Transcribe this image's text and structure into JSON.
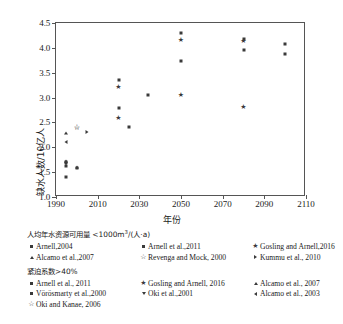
{
  "chart_data": {
    "type": "scatter",
    "title": "",
    "xlabel": "年份",
    "ylabel": "缺水人数/10亿人",
    "xlim": [
      1990,
      2110
    ],
    "ylim": [
      1.0,
      4.5
    ],
    "xticks": [
      1990,
      2010,
      2030,
      2050,
      2070,
      2090,
      2110
    ],
    "yticks": [
      "1.0",
      "1.5",
      "2.0",
      "2.5",
      "3.0",
      "3.5",
      "4.0",
      "4.5"
    ],
    "grid": false,
    "legend_position": "below-plot",
    "series": [
      {
        "name": "Arnell,2004",
        "marker": "square",
        "group": "availability",
        "points": [
          {
            "x": 1995,
            "y": 1.63
          },
          {
            "x": 1995,
            "y": 1.41
          }
        ]
      },
      {
        "name": "Alcamo et al.,2007",
        "marker": "triangle-up",
        "group": "availability",
        "points": [
          {
            "x": 1995,
            "y": 2.29
          }
        ]
      },
      {
        "name": "Arnell et al.,2011",
        "marker": "square",
        "group": "availability",
        "points": [
          {
            "x": 2020,
            "y": 2.79
          },
          {
            "x": 2025,
            "y": 2.41
          },
          {
            "x": 2050,
            "y": 3.74
          }
        ]
      },
      {
        "name": "Revenga and Mock, 2000",
        "marker": "star-open",
        "group": "availability",
        "points": [
          {
            "x": 2000,
            "y": 2.4
          }
        ]
      },
      {
        "name": "Gosling and Arnell,2016",
        "marker": "star",
        "group": "availability",
        "points": [
          {
            "x": 2020,
            "y": 3.21
          },
          {
            "x": 2050,
            "y": 4.15
          },
          {
            "x": 2080,
            "y": 4.13
          }
        ]
      },
      {
        "name": "Kummu et al., 2010",
        "marker": "triangle-right",
        "group": "availability",
        "points": [
          {
            "x": 2005,
            "y": 2.3
          }
        ]
      },
      {
        "name": "Arnell et al., 2011",
        "marker": "square",
        "group": "stress",
        "points": [
          {
            "x": 2020,
            "y": 3.36
          },
          {
            "x": 2034,
            "y": 3.06
          },
          {
            "x": 2050,
            "y": 4.3
          },
          {
            "x": 2080,
            "y": 4.18
          },
          {
            "x": 2100,
            "y": 4.07
          }
        ]
      },
      {
        "name": "Gosling and Arnell, 2016",
        "marker": "star",
        "group": "stress",
        "points": [
          {
            "x": 2020,
            "y": 2.59
          },
          {
            "x": 2050,
            "y": 3.06
          },
          {
            "x": 2080,
            "y": 2.81
          }
        ]
      },
      {
        "name": "Alcamo et al., 2007",
        "marker": "triangle-up",
        "group": "stress",
        "points": [
          {
            "x": 1995,
            "y": 1.73
          },
          {
            "x": 2000,
            "y": 1.6
          }
        ]
      },
      {
        "name": "Vörösmarty et al.,2000",
        "marker": "square",
        "group": "stress",
        "points": [
          {
            "x": 1995,
            "y": 1.7
          },
          {
            "x": 2000,
            "y": 1.58
          },
          {
            "x": 2080,
            "y": 3.96
          },
          {
            "x": 2100,
            "y": 3.87
          }
        ]
      },
      {
        "name": "Oki et al.,2001",
        "marker": "triangle-down",
        "group": "stress",
        "points": [
          {
            "x": 1995,
            "y": 1.67
          }
        ]
      },
      {
        "name": "Alcamo et al., 2003",
        "marker": "triangle-left",
        "group": "stress",
        "points": [
          {
            "x": 1995,
            "y": 2.11
          }
        ]
      },
      {
        "name": "Oki and Kanae, 2006",
        "marker": "star-open",
        "group": "stress",
        "points": [
          {
            "x": 2000,
            "y": 2.38
          }
        ]
      }
    ]
  },
  "axes": {
    "y_title": "缺水人数/10亿人",
    "x_title": "年份",
    "y_tick_labels": [
      "4.5",
      "4.0",
      "3.5",
      "3.0",
      "2.5",
      "2.0",
      "1.5",
      "1.0"
    ],
    "x_tick_labels": [
      "1990",
      "2010",
      "2030",
      "2050",
      "2070",
      "2090",
      "2110"
    ]
  },
  "legend": {
    "group1_header": "人均年水资源可用量 <1000m",
    "group1_header_sup": "3",
    "group1_header_tail": "/(人·a)",
    "group2_header": "紧迫系数>40%",
    "group1_rows": [
      [
        {
          "marker": "square",
          "label": "Arnell,2004"
        },
        {
          "marker": "square",
          "label": "Arnell et al.,2011"
        },
        {
          "marker": "star",
          "label": "Gosling and Arnell,2016"
        }
      ],
      [
        {
          "marker": "triangle-up",
          "label": "Alcamo et al.,2007"
        },
        {
          "marker": "star-open",
          "label": "Revenga and Mock, 2000"
        },
        {
          "marker": "triangle-right",
          "label": "Kummu et al., 2010"
        }
      ]
    ],
    "group2_rows": [
      [
        {
          "marker": "square",
          "label": "Arnell et al., 2011"
        },
        {
          "marker": "star",
          "label": "Gosling and Arnell, 2016"
        },
        {
          "marker": "triangle-up",
          "label": "Alcamo et al., 2007"
        }
      ],
      [
        {
          "marker": "square",
          "label": "Vörösmarty et al.,2000"
        },
        {
          "marker": "triangle-down",
          "label": "Oki et al.,2001"
        },
        {
          "marker": "triangle-left",
          "label": "Alcamo et al., 2003"
        }
      ],
      [
        {
          "marker": "star-open",
          "label": "Oki and Kanae, 2006"
        }
      ]
    ]
  },
  "colors": {
    "marker": "#3a3a3a",
    "axis": "#555555",
    "text": "#1a1a1a",
    "background": "#ffffff"
  }
}
